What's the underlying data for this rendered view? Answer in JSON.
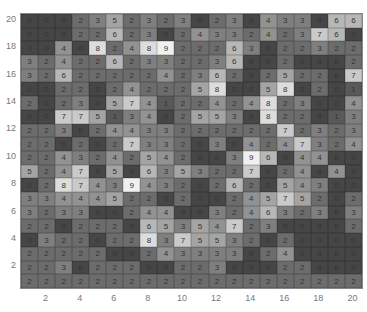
{
  "chart_data": {
    "type": "heatmap",
    "title": "",
    "xlabel": "",
    "ylabel": "",
    "x_ticks": [
      2,
      4,
      6,
      8,
      10,
      12,
      14,
      16,
      18,
      20
    ],
    "y_ticks": [
      2,
      4,
      6,
      8,
      10,
      12,
      14,
      16,
      18,
      20
    ],
    "xlim": [
      1,
      20
    ],
    "ylim": [
      1,
      20
    ],
    "colormap": "gray (low=dark, high=light)",
    "rows_top_to_bottom": [
      [
        0,
        0,
        0,
        2,
        3,
        5,
        2,
        3,
        2,
        3,
        0,
        2,
        3,
        0,
        4,
        3,
        3,
        0,
        6,
        6
      ],
      [
        0,
        0,
        0,
        2,
        2,
        6,
        2,
        3,
        0,
        2,
        4,
        3,
        3,
        2,
        4,
        2,
        3,
        7,
        6,
        0
      ],
      [
        0,
        0,
        4,
        0,
        8,
        2,
        4,
        8,
        9,
        2,
        2,
        2,
        6,
        3,
        0,
        2,
        2,
        3,
        2,
        2
      ],
      [
        3,
        2,
        4,
        2,
        2,
        6,
        2,
        3,
        3,
        2,
        2,
        3,
        6,
        0,
        0,
        2,
        0,
        0,
        0,
        2
      ],
      [
        3,
        2,
        6,
        2,
        2,
        2,
        2,
        2,
        4,
        2,
        3,
        6,
        2,
        0,
        2,
        5,
        2,
        2,
        0,
        7
      ],
      [
        0,
        0,
        2,
        2,
        0,
        2,
        4,
        2,
        2,
        2,
        5,
        8,
        0,
        0,
        5,
        8,
        0,
        2,
        0,
        1
      ],
      [
        2,
        0,
        2,
        3,
        0,
        5,
        7,
        4,
        1,
        2,
        2,
        4,
        2,
        4,
        8,
        2,
        3,
        0,
        0,
        4
      ],
      [
        0,
        0,
        7,
        7,
        5,
        1,
        3,
        4,
        0,
        2,
        5,
        5,
        3,
        0,
        8,
        2,
        2,
        0,
        1,
        3
      ],
      [
        2,
        2,
        3,
        0,
        2,
        4,
        4,
        3,
        3,
        2,
        2,
        2,
        2,
        2,
        2,
        7,
        2,
        3,
        2,
        3
      ],
      [
        2,
        2,
        0,
        2,
        0,
        2,
        7,
        3,
        3,
        2,
        0,
        3,
        0,
        4,
        2,
        4,
        7,
        3,
        2,
        4
      ],
      [
        2,
        2,
        4,
        3,
        2,
        4,
        2,
        5,
        4,
        2,
        0,
        0,
        3,
        9,
        6,
        0,
        4,
        4,
        0,
        0
      ],
      [
        5,
        2,
        4,
        7,
        0,
        5,
        0,
        6,
        3,
        5,
        3,
        2,
        2,
        7,
        0,
        2,
        4,
        0,
        4,
        0
      ],
      [
        0,
        2,
        8,
        7,
        4,
        3,
        9,
        4,
        3,
        2,
        0,
        2,
        6,
        2,
        0,
        5,
        4,
        3,
        0,
        0
      ],
      [
        3,
        3,
        4,
        4,
        4,
        5,
        2,
        2,
        0,
        2,
        0,
        0,
        2,
        4,
        5,
        7,
        5,
        2,
        0,
        2
      ],
      [
        3,
        2,
        3,
        3,
        0,
        0,
        2,
        4,
        4,
        0,
        0,
        3,
        2,
        4,
        6,
        3,
        2,
        3,
        0,
        3
      ],
      [
        2,
        2,
        0,
        2,
        2,
        2,
        0,
        6,
        5,
        3,
        5,
        4,
        7,
        2,
        3,
        0,
        0,
        0,
        0,
        2
      ],
      [
        0,
        3,
        2,
        2,
        0,
        2,
        2,
        8,
        3,
        7,
        5,
        5,
        3,
        2,
        0,
        2,
        0,
        0,
        0,
        0
      ],
      [
        2,
        2,
        2,
        2,
        2,
        0,
        0,
        2,
        4,
        3,
        3,
        3,
        3,
        0,
        2,
        4,
        0,
        0,
        0,
        0
      ],
      [
        2,
        2,
        3,
        0,
        2,
        2,
        2,
        0,
        0,
        2,
        2,
        3,
        0,
        0,
        0,
        2,
        2,
        0,
        0,
        0
      ],
      [
        2,
        2,
        2,
        2,
        2,
        2,
        2,
        2,
        2,
        2,
        2,
        2,
        2,
        2,
        2,
        2,
        2,
        2,
        2,
        2
      ]
    ]
  }
}
